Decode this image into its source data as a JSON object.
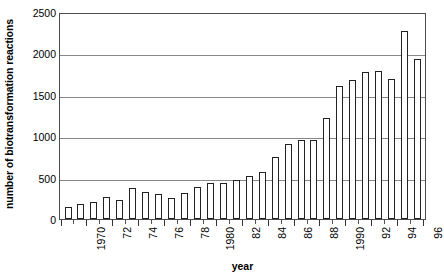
{
  "chart_data": {
    "type": "bar",
    "title": "",
    "subtitle": "",
    "xlabel": "year",
    "ylabel": "number of biotransformation reactions",
    "ylim": [
      0,
      2500
    ],
    "ytick_values": [
      0,
      500,
      1000,
      1500,
      2000,
      2500
    ],
    "ytick_labels": [
      "0",
      "500",
      "1000",
      "1500",
      "2000",
      "2500"
    ],
    "grid": true,
    "legend": null,
    "legend_position": "none",
    "categories": [
      "1970",
      "1971",
      "1972",
      "1973",
      "1974",
      "1975",
      "1976",
      "1977",
      "1978",
      "1979",
      "1980",
      "1981",
      "1982",
      "1983",
      "1984",
      "1985",
      "1986",
      "1987",
      "1988",
      "1989",
      "1990",
      "1991",
      "1992",
      "1993",
      "1994",
      "1995",
      "1996",
      "1997"
    ],
    "xtick_labels_shown": [
      "1970",
      "72",
      "74",
      "76",
      "78",
      "1980",
      "82",
      "84",
      "86",
      "88",
      "1990",
      "92",
      "94",
      "96"
    ],
    "values": [
      145,
      180,
      205,
      260,
      225,
      370,
      330,
      300,
      250,
      310,
      385,
      435,
      430,
      470,
      525,
      570,
      755,
      900,
      955,
      950,
      1225,
      1610,
      1680,
      1780,
      1790,
      1690,
      2270,
      1930
    ],
    "bar_facecolor": "#ffffff",
    "bar_edgecolor": "#222222",
    "axis_color": "#4d4d4d",
    "gridline_color": "#878787",
    "background_color": "#ffffff"
  }
}
